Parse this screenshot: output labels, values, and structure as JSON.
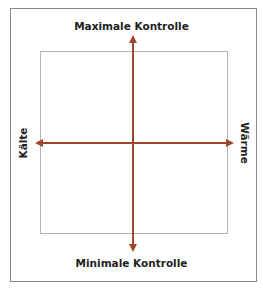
{
  "diagram": {
    "type": "quadrant",
    "axes": {
      "vertical": {
        "top_label": "Maximale Kontrolle",
        "bottom_label": "Minimale Kontrolle"
      },
      "horizontal": {
        "left_label": "Kälte",
        "right_label": "Wärme"
      }
    },
    "colors": {
      "axis": "#a0462a",
      "frame": "#8a8a8a",
      "inner_frame": "#b5b5b5",
      "text": "#1e1e1e"
    }
  }
}
